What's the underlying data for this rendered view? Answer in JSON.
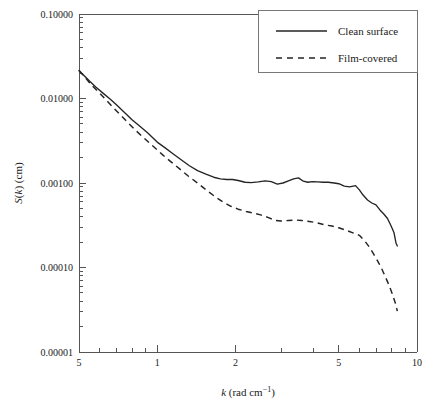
{
  "chart_data": {
    "type": "line",
    "title": "",
    "subtitle": "",
    "xlabel": "k (rad cm⁻¹)",
    "xlabel_parts": {
      "symbol": "k",
      "units": " (rad cm",
      "exponent": "−1",
      "close": ")"
    },
    "ylabel": "S(k) (cm)",
    "ylabel_parts": {
      "pre": "S(",
      "symbol": "k",
      "post": ") (cm)"
    },
    "xscale": "log",
    "yscale": "log",
    "xlim": [
      0.5,
      10
    ],
    "ylim": [
      1e-05,
      0.1
    ],
    "grid": false,
    "legend_position": "top-right",
    "x_major_ticks": [
      0.5,
      1,
      2,
      5,
      10
    ],
    "x_major_tick_labels": [
      "5",
      "1",
      "2",
      "5",
      "10"
    ],
    "x_minor_ticks": [
      0.6,
      0.7,
      0.8,
      0.9,
      3,
      4,
      6,
      7,
      8,
      9
    ],
    "y_major_ticks": [
      0.1,
      0.01,
      0.001,
      0.0001,
      1e-05
    ],
    "y_major_tick_labels": [
      "0.10000",
      "0.01000",
      "0.00100",
      "0.00010",
      "0.00001"
    ],
    "series": [
      {
        "name": "Clean surface",
        "style": "solid",
        "color": "#242424",
        "x": [
          0.5,
          0.52,
          0.55,
          0.58,
          0.62,
          0.66,
          0.7,
          0.75,
          0.8,
          0.86,
          0.92,
          1.0,
          1.07,
          1.15,
          1.24,
          1.33,
          1.43,
          1.54,
          1.65,
          1.75,
          1.85,
          1.95,
          2.05,
          2.18,
          2.3,
          2.45,
          2.6,
          2.75,
          2.9,
          3.05,
          3.2,
          3.35,
          3.5,
          3.65,
          3.8,
          3.95,
          4.15,
          4.35,
          4.55,
          4.8,
          5.0,
          5.25,
          5.5,
          5.8,
          6.0,
          6.2,
          6.45,
          6.7,
          6.95,
          7.2,
          7.45,
          7.7,
          7.95,
          8.15,
          8.3,
          8.4
        ],
        "y": [
          0.0215,
          0.019,
          0.016,
          0.0137,
          0.0115,
          0.0098,
          0.0083,
          0.0068,
          0.0056,
          0.00465,
          0.0039,
          0.00305,
          0.00262,
          0.00222,
          0.00187,
          0.0016,
          0.0014,
          0.00127,
          0.00117,
          0.00112,
          0.0011,
          0.0011,
          0.00107,
          0.00102,
          0.00101,
          0.00103,
          0.00106,
          0.00104,
          0.00097,
          0.001,
          0.00106,
          0.00112,
          0.00115,
          0.00105,
          0.00102,
          0.00104,
          0.00103,
          0.00102,
          0.00102,
          0.001,
          0.00098,
          0.00092,
          0.0009,
          0.00093,
          0.00083,
          0.00072,
          0.00063,
          0.00058,
          0.00055,
          0.00048,
          0.00043,
          0.00038,
          0.00031,
          0.00026,
          0.000195,
          0.00018
        ]
      },
      {
        "name": "Film-covered",
        "style": "dashed",
        "color": "#242424",
        "x": [
          0.5,
          0.53,
          0.56,
          0.6,
          0.64,
          0.68,
          0.73,
          0.78,
          0.84,
          0.9,
          0.97,
          1.05,
          1.13,
          1.22,
          1.32,
          1.43,
          1.55,
          1.68,
          1.8,
          1.92,
          2.05,
          2.2,
          2.35,
          2.5,
          2.68,
          2.85,
          3.0,
          3.2,
          3.4,
          3.6,
          3.85,
          4.1,
          4.4,
          4.7,
          5.0,
          5.35,
          5.7,
          6.0,
          6.3,
          6.55,
          6.8,
          7.05,
          7.3,
          7.55,
          7.8,
          8.05,
          8.25,
          8.4
        ],
        "y": [
          0.0215,
          0.0175,
          0.0143,
          0.0116,
          0.0094,
          0.0077,
          0.0062,
          0.005,
          0.004,
          0.0033,
          0.00268,
          0.00215,
          0.00178,
          0.00147,
          0.0012,
          0.001,
          0.00082,
          0.00068,
          0.00059,
          0.00053,
          0.00049,
          0.00046,
          0.00044,
          0.00042,
          0.00039,
          0.00036,
          0.000355,
          0.00036,
          0.000365,
          0.00036,
          0.00035,
          0.00034,
          0.00032,
          0.00031,
          0.000295,
          0.000275,
          0.000255,
          0.00024,
          0.000205,
          0.000175,
          0.000145,
          0.00012,
          9.8e-05,
          7.8e-05,
          6.2e-05,
          4.8e-05,
          3.8e-05,
          3.05e-05
        ]
      }
    ]
  },
  "legend": {
    "entries": [
      {
        "label": "Clean surface",
        "style": "solid"
      },
      {
        "label": "Film-covered",
        "style": "dashed"
      }
    ]
  }
}
